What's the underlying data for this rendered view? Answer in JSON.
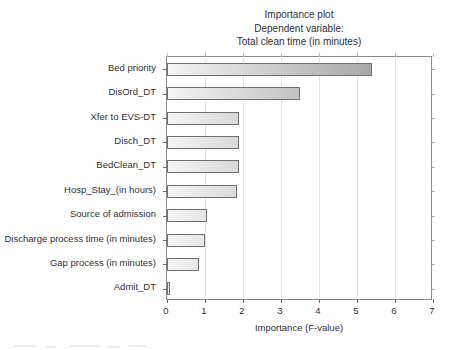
{
  "title": {
    "line1": "Importance plot",
    "line2": "Dependent variable:",
    "line3": "Total clean time (in minutes)"
  },
  "axes": {
    "xlabel": "Importance (F-value)",
    "ylabel": "",
    "xticks": [
      "0",
      "1",
      "2",
      "3",
      "4",
      "5",
      "6",
      "7"
    ]
  },
  "colors": {
    "frame": "#8a8a8a",
    "gridline": "#e2e2e2",
    "bar_border": "#6f6f6f",
    "bar_light": "#f4f4f4",
    "bar_dark": "#8e8e8e",
    "text": "#2f2f2f",
    "background": "#ffffff"
  },
  "chart_data": {
    "type": "bar",
    "orientation": "horizontal",
    "title": "Importance plot\nDependent variable:\nTotal clean time (in minutes)",
    "xlabel": "Importance (F-value)",
    "ylabel": "",
    "xlim": [
      0,
      7
    ],
    "grid": true,
    "legend": null,
    "categories": [
      "Bed priority",
      "DisOrd_DT",
      "Xfer to EVS-DT",
      "Disch_DT",
      "BedClean_DT",
      "Hosp_Stay_(in hours)",
      "Source of admission",
      "Discharge process time (in minutes)",
      "Gap process (in minutes)",
      "Admit_DT"
    ],
    "values": [
      5.4,
      3.5,
      1.9,
      1.9,
      1.9,
      1.85,
      1.05,
      1.0,
      0.85,
      0.08
    ]
  }
}
